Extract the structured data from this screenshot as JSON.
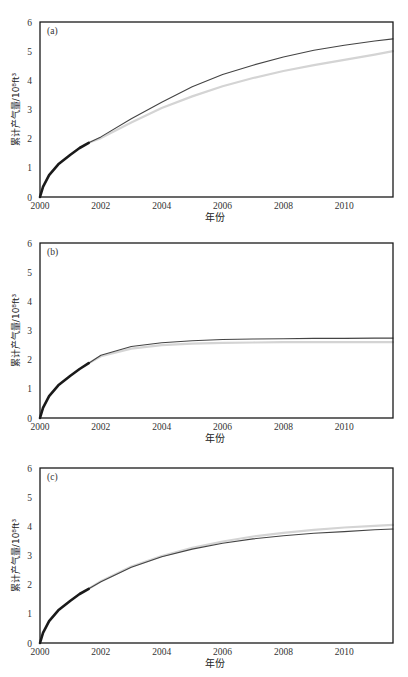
{
  "chart_data": [
    {
      "type": "line",
      "panel_label": "(a)",
      "xlabel": "年份",
      "ylabel": "累计产气量/10⁸ft³",
      "xlim": [
        2000,
        2011.6
      ],
      "ylim": [
        0,
        6
      ],
      "xticks": [
        2000,
        2002,
        2004,
        2006,
        2008,
        2010
      ],
      "yticks": [
        0,
        1,
        2,
        3,
        4,
        5,
        6
      ],
      "grid": false,
      "series": [
        {
          "name": "history",
          "style": "thick-dark",
          "x": [
            2000,
            2000.1,
            2000.3,
            2000.6,
            2001.0,
            2001.3,
            2001.6
          ],
          "y": [
            0,
            0.35,
            0.75,
            1.12,
            1.45,
            1.68,
            1.86
          ]
        },
        {
          "name": "forecast-faint",
          "style": "light-gray",
          "x": [
            2001.6,
            2002,
            2003,
            2004,
            2005,
            2006,
            2007,
            2008,
            2009,
            2010,
            2011,
            2011.6
          ],
          "y": [
            1.86,
            2.02,
            2.55,
            3.05,
            3.45,
            3.8,
            4.08,
            4.32,
            4.52,
            4.7,
            4.88,
            5.0
          ]
        },
        {
          "name": "forecast",
          "style": "thin-dark",
          "x": [
            2001.6,
            2002,
            2003,
            2004,
            2005,
            2006,
            2007,
            2008,
            2009,
            2010,
            2011,
            2011.6
          ],
          "y": [
            1.86,
            2.06,
            2.68,
            3.25,
            3.78,
            4.2,
            4.52,
            4.8,
            5.03,
            5.2,
            5.35,
            5.42
          ]
        }
      ]
    },
    {
      "type": "line",
      "panel_label": "(b)",
      "xlabel": "年份",
      "ylabel": "累计产气量/10⁸ft³",
      "xlim": [
        2000,
        2011.6
      ],
      "ylim": [
        0,
        6
      ],
      "xticks": [
        2000,
        2002,
        2004,
        2006,
        2008,
        2010
      ],
      "yticks": [
        0,
        1,
        2,
        3,
        4,
        5,
        6
      ],
      "grid": false,
      "series": [
        {
          "name": "history",
          "style": "thick-dark",
          "x": [
            2000,
            2000.1,
            2000.3,
            2000.6,
            2001.0,
            2001.3,
            2001.6
          ],
          "y": [
            0,
            0.35,
            0.75,
            1.12,
            1.45,
            1.68,
            1.88
          ]
        },
        {
          "name": "forecast-faint",
          "style": "light-gray",
          "x": [
            2001.6,
            2002,
            2003,
            2004,
            2005,
            2006,
            2007,
            2008,
            2009,
            2010,
            2011,
            2011.6
          ],
          "y": [
            1.88,
            2.12,
            2.38,
            2.5,
            2.55,
            2.58,
            2.59,
            2.6,
            2.6,
            2.6,
            2.6,
            2.6
          ]
        },
        {
          "name": "forecast",
          "style": "thin-dark",
          "x": [
            2001.6,
            2002,
            2003,
            2004,
            2005,
            2006,
            2007,
            2008,
            2009,
            2010,
            2011,
            2011.6
          ],
          "y": [
            1.88,
            2.15,
            2.45,
            2.58,
            2.65,
            2.69,
            2.71,
            2.72,
            2.73,
            2.73,
            2.74,
            2.74
          ]
        }
      ]
    },
    {
      "type": "line",
      "panel_label": "(c)",
      "xlabel": "年份",
      "ylabel": "累计产气量/10⁸ft³",
      "xlim": [
        2000,
        2011.6
      ],
      "ylim": [
        0,
        6
      ],
      "xticks": [
        2000,
        2002,
        2004,
        2006,
        2008,
        2010
      ],
      "yticks": [
        0,
        1,
        2,
        3,
        4,
        5,
        6
      ],
      "grid": false,
      "series": [
        {
          "name": "history",
          "style": "thick-dark",
          "x": [
            2000,
            2000.1,
            2000.3,
            2000.6,
            2001.0,
            2001.3,
            2001.6
          ],
          "y": [
            0,
            0.35,
            0.75,
            1.12,
            1.45,
            1.68,
            1.86
          ]
        },
        {
          "name": "forecast-faint",
          "style": "light-gray",
          "x": [
            2001.6,
            2002,
            2003,
            2004,
            2005,
            2006,
            2007,
            2008,
            2009,
            2010,
            2011,
            2011.6
          ],
          "y": [
            1.86,
            2.12,
            2.62,
            2.98,
            3.26,
            3.48,
            3.65,
            3.78,
            3.88,
            3.96,
            4.02,
            4.05
          ]
        },
        {
          "name": "forecast",
          "style": "thin-dark",
          "x": [
            2001.6,
            2002,
            2003,
            2004,
            2005,
            2006,
            2007,
            2008,
            2009,
            2010,
            2011,
            2011.6
          ],
          "y": [
            1.86,
            2.1,
            2.6,
            2.96,
            3.22,
            3.42,
            3.57,
            3.68,
            3.76,
            3.82,
            3.88,
            3.91
          ]
        }
      ]
    }
  ],
  "panels": [
    {
      "label": "(a)",
      "top": 22
    },
    {
      "label": "(b)",
      "top": 243
    },
    {
      "label": "(c)",
      "top": 468
    }
  ],
  "axis": {
    "xlabel": "年份",
    "ylabel": "累计产气量/10⁸ft³"
  },
  "colors": {
    "frame": "#1a1a1a",
    "history": "#1a1a1a",
    "forecast": "#444444",
    "forecast_faint": "#d4d4d4"
  }
}
